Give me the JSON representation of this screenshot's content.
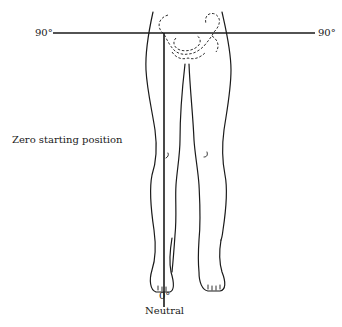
{
  "diagram": {
    "type": "anatomical-range-of-motion",
    "labels": {
      "left_angle": "90°",
      "right_angle": "90°",
      "position_caption": "Zero starting position",
      "bottom_angle": "0°",
      "bottom_caption": "Neutral"
    },
    "lines": {
      "horizontal_reference": "90° line across pelvis",
      "vertical_reference": "0° neutral line along right leg"
    },
    "colors": {
      "ink": "#1a1a1a",
      "background": "#ffffff"
    }
  }
}
